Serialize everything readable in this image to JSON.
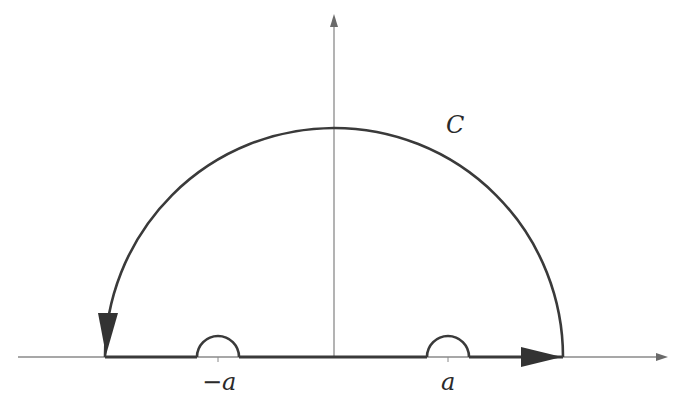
{
  "diagram": {
    "type": "contour-integral-diagram",
    "labels": {
      "contour": "C",
      "left_pole": "−a",
      "right_pole": "a"
    },
    "colors": {
      "axis": "#8a8a8a",
      "contour": "#3a3a3a",
      "text": "#2a2a2a",
      "background": "#ffffff"
    },
    "geometry": {
      "origin": [
        334,
        357
      ],
      "big_radius": 229,
      "indent_radius": 21,
      "left_pole_x": 218,
      "right_pole_x": 448
    }
  }
}
